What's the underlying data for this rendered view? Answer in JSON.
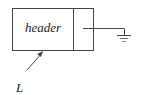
{
  "diagram": {
    "type": "linked-list-node",
    "node": {
      "field_label": "header",
      "next_pointer": "null (ground symbol)"
    },
    "pointer_label": "L"
  }
}
